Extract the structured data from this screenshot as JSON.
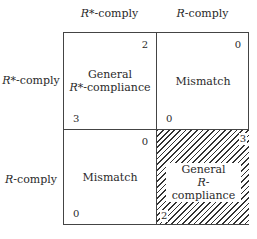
{
  "columns": [
    {
      "var": "R",
      "sup": "*",
      "rest": "-comply"
    },
    {
      "var": "R",
      "sup": "",
      "rest": "-comply"
    }
  ],
  "rows": [
    {
      "var": "R",
      "sup": "*",
      "rest": "-comply"
    },
    {
      "var": "R",
      "sup": "",
      "rest": "-comply"
    }
  ],
  "cells": [
    {
      "line1": "General",
      "line2_var": "R",
      "line2_sup": "*",
      "line2_rest": "-compliance",
      "payoff_top_right": "2",
      "payoff_bottom_left": "3",
      "hatched": false
    },
    {
      "line1": "Mismatch",
      "payoff_top_right": "0",
      "payoff_bottom_left": "0",
      "hatched": false
    },
    {
      "line1": "Mismatch",
      "payoff_top_right": "0",
      "payoff_bottom_left": "0",
      "hatched": false
    },
    {
      "line1": "General",
      "line2_var": "R",
      "line2_sup": "",
      "line2_rest": "-compliance",
      "payoff_top_right": "3",
      "payoff_bottom_left": "2",
      "hatched": true
    }
  ]
}
